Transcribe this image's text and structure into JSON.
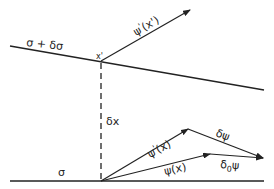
{
  "diagram": {
    "type": "variation-geometry",
    "colors": {
      "line": "#222222",
      "background": "#ffffff"
    },
    "surfaces": [
      {
        "id": "upper",
        "label": "σ + δσ"
      },
      {
        "id": "lower",
        "label": "σ"
      }
    ],
    "points": {
      "x_prime": {
        "label": "x'"
      }
    },
    "displacement": {
      "label": "δx"
    },
    "vectors": [
      {
        "id": "psi_prime_x_prime",
        "label_main": "ψ",
        "label_sup": "'",
        "label_arg": "(x')"
      },
      {
        "id": "psi_prime_x",
        "label_main": "ψ",
        "label_sup": "'",
        "label_arg": "(x)"
      },
      {
        "id": "psi_x",
        "label": "ψ(x)"
      },
      {
        "id": "delta_psi",
        "label": "δψ"
      },
      {
        "id": "delta0_psi",
        "label_main": "δ",
        "label_sub": "0",
        "label_tail": "ψ"
      }
    ]
  }
}
